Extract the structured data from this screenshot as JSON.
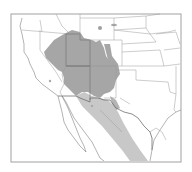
{
  "map": {
    "type": "species-range-map",
    "region": "Western United States and Northern Mexico",
    "colors": {
      "background": "#ffffff",
      "frame": "#8a8a8a",
      "boundary_lines": "#9a9a9a",
      "range_primary": "#a6a6a6",
      "range_secondary": "#c8c8c8",
      "isolated_points": "#a0a0a0"
    },
    "legend": [],
    "labels": []
  }
}
